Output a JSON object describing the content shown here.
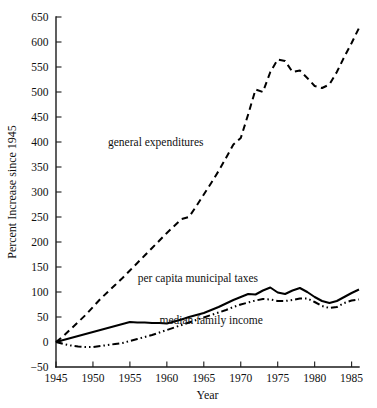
{
  "chart_data": {
    "type": "line",
    "title": "",
    "xlabel": "Year",
    "ylabel": "Percent Increase since 1945",
    "xlim": [
      1945,
      1986
    ],
    "ylim": [
      -50,
      650
    ],
    "ytick_values": [
      -50,
      0,
      50,
      100,
      150,
      200,
      250,
      300,
      350,
      400,
      450,
      500,
      550,
      600,
      650
    ],
    "ytick_labels": [
      "−50",
      "0",
      "50",
      "100",
      "150",
      "200",
      "250",
      "300",
      "350",
      "400",
      "450",
      "500",
      "550",
      "600",
      "650"
    ],
    "xtick_values": [
      1945,
      1950,
      1955,
      1960,
      1965,
      1970,
      1975,
      1980,
      1985
    ],
    "xtick_labels": [
      "1945",
      "1950",
      "1955",
      "1960",
      "1965",
      "1970",
      "1975",
      "1980",
      "1985"
    ],
    "grid": false,
    "legend_position": "inline-annotations",
    "series": [
      {
        "name": "general expenditures",
        "style": "dashed",
        "label_x": 1958.5,
        "label_y": 392,
        "x": [
          1945,
          1946,
          1947,
          1948,
          1949,
          1950,
          1951,
          1952,
          1953,
          1954,
          1955,
          1956,
          1957,
          1958,
          1959,
          1960,
          1961,
          1962,
          1963,
          1964,
          1965,
          1966,
          1967,
          1968,
          1969,
          1970,
          1971,
          1972,
          1973,
          1974,
          1975,
          1976,
          1977,
          1978,
          1979,
          1980,
          1981,
          1982,
          1983,
          1984,
          1985,
          1986
        ],
        "values": [
          0,
          12,
          26,
          40,
          54,
          70,
          86,
          100,
          114,
          128,
          143,
          158,
          173,
          188,
          203,
          218,
          232,
          246,
          250,
          272,
          295,
          318,
          342,
          368,
          395,
          408,
          455,
          505,
          500,
          540,
          565,
          562,
          540,
          543,
          528,
          512,
          508,
          515,
          540,
          570,
          598,
          628
        ]
      },
      {
        "name": "per capita municipal taxes",
        "style": "solid",
        "label_x": 1964.2,
        "label_y": 120,
        "x": [
          1945,
          1950,
          1955,
          1956,
          1957,
          1958,
          1959,
          1960,
          1961,
          1962,
          1963,
          1964,
          1965,
          1966,
          1967,
          1968,
          1969,
          1970,
          1971,
          1972,
          1973,
          1974,
          1975,
          1976,
          1977,
          1978,
          1979,
          1980,
          1981,
          1982,
          1983,
          1984,
          1985,
          1986
        ],
        "values": [
          0,
          20,
          40,
          39,
          39,
          38,
          38,
          37,
          41,
          45,
          50,
          54,
          58,
          64,
          70,
          77,
          84,
          90,
          96,
          95,
          103,
          109,
          99,
          96,
          103,
          108,
          100,
          90,
          82,
          78,
          82,
          90,
          98,
          105
        ]
      },
      {
        "name": "median family income",
        "style": "dash-dot-dot",
        "label_x": 1966.0,
        "label_y": 36,
        "x": [
          1945,
          1946,
          1947,
          1948,
          1949,
          1950,
          1951,
          1952,
          1953,
          1954,
          1955,
          1956,
          1957,
          1958,
          1959,
          1960,
          1961,
          1962,
          1963,
          1964,
          1965,
          1966,
          1967,
          1968,
          1969,
          1970,
          1971,
          1972,
          1973,
          1974,
          1975,
          1976,
          1977,
          1978,
          1979,
          1980,
          1981,
          1982,
          1983,
          1984,
          1985,
          1986
        ],
        "values": [
          0,
          -4,
          -7,
          -9,
          -10,
          -10,
          -8,
          -6,
          -4,
          -2,
          2,
          6,
          10,
          14,
          19,
          24,
          29,
          34,
          39,
          44,
          49,
          54,
          59,
          64,
          70,
          75,
          79,
          83,
          86,
          85,
          82,
          82,
          84,
          87,
          87,
          80,
          72,
          68,
          70,
          78,
          83,
          85
        ]
      }
    ]
  }
}
